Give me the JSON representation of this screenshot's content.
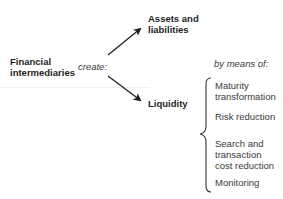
{
  "diagram": {
    "source": {
      "line1": "Financial",
      "line2": "intermediaries"
    },
    "verb": "create:",
    "outputs": [
      {
        "line1": "Assets and",
        "line2": "liabilities"
      },
      {
        "line1": "Liquidity"
      }
    ],
    "means_label": "by means of:",
    "means": [
      {
        "line1": "Maturity",
        "line2": "transformation"
      },
      {
        "line1": "Risk reduction"
      },
      {
        "line1": "Search and",
        "line2": "transaction",
        "line3": "cost reduction"
      },
      {
        "line1": "Monitoring"
      }
    ],
    "colors": {
      "text": "#1e1e1e",
      "arrow": "#222222",
      "brace": "#333333"
    }
  }
}
